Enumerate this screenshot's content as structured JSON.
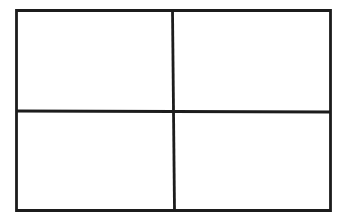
{
  "diagram": {
    "type": "grid",
    "rows": 2,
    "cols": 2,
    "background": "#ffffff",
    "stroke_color": "#1c1c1c",
    "stroke_width": 2.8,
    "outer": {
      "x1": 16.5,
      "y1": 10.5,
      "x2": 330.5,
      "y2": 210.5
    },
    "divider_vertical": {
      "x_top": 172.5,
      "x_bottom": 174.5,
      "y1": 10.5,
      "y2": 210.5
    },
    "divider_horizontal": {
      "x1": 16.5,
      "x2": 330.5,
      "y_left": 111,
      "y_right": 112
    },
    "cells": [
      {
        "row": 0,
        "col": 0,
        "label": ""
      },
      {
        "row": 0,
        "col": 1,
        "label": ""
      },
      {
        "row": 1,
        "col": 0,
        "label": ""
      },
      {
        "row": 1,
        "col": 1,
        "label": ""
      }
    ]
  }
}
